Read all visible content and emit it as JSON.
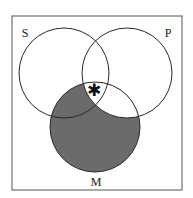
{
  "diagram": {
    "type": "venn",
    "title": "",
    "frame": {
      "x": 12,
      "y": 16,
      "width": 170,
      "height": 174
    },
    "sets": [
      {
        "id": "S",
        "label": "S",
        "cx": 64,
        "cy": 73,
        "r": 45,
        "label_x": 25,
        "label_y": 37
      },
      {
        "id": "P",
        "label": "P",
        "cx": 127,
        "cy": 73,
        "r": 45,
        "label_x": 168,
        "label_y": 37
      },
      {
        "id": "M",
        "label": "M",
        "cx": 95,
        "cy": 127,
        "r": 45,
        "label_x": 96,
        "label_y": 186
      }
    ],
    "shaded_regions": [
      "M-S-notP",
      "M-notS-notP"
    ],
    "shade_color": "#6b6b6b",
    "line_color": "#2a2a2a",
    "marker": {
      "symbol": "✱",
      "region": "S-P-M",
      "x": 94,
      "y": 96
    }
  }
}
